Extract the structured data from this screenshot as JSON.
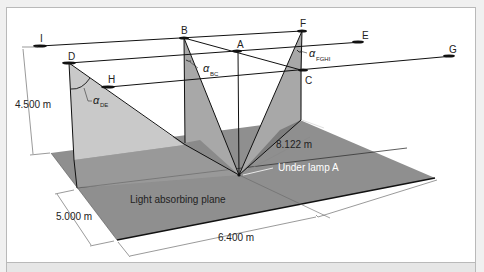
{
  "diagram": {
    "lamps": [
      {
        "id": "I",
        "label": "I"
      },
      {
        "id": "B",
        "label": "B"
      },
      {
        "id": "F",
        "label": "F"
      },
      {
        "id": "D",
        "label": "D"
      },
      {
        "id": "A",
        "label": "A"
      },
      {
        "id": "E",
        "label": "E"
      },
      {
        "id": "H",
        "label": "H"
      },
      {
        "id": "C",
        "label": "C"
      },
      {
        "id": "G",
        "label": "G"
      }
    ],
    "angles": [
      {
        "id": "DE",
        "symbol": "α",
        "subscript": "DE"
      },
      {
        "id": "BC",
        "symbol": "α",
        "subscript": "BC"
      },
      {
        "id": "FGHI",
        "symbol": "α",
        "subscript": "FGHI"
      }
    ],
    "dimensions": {
      "height": "4.500  m",
      "depth": "5.000  m",
      "width": "6.400  m",
      "distance": "8.122  m"
    },
    "labels": {
      "plane": "Light absorbing plane",
      "under_lamp": "Under lamp A"
    },
    "colors": {
      "plane": "#8f8f8f",
      "plane_light": "#a3a3a3",
      "triangle_light": "#c9c9c9",
      "triangle_mid": "#a8a8a8",
      "triangle_dark": "#7e7e7e"
    }
  }
}
